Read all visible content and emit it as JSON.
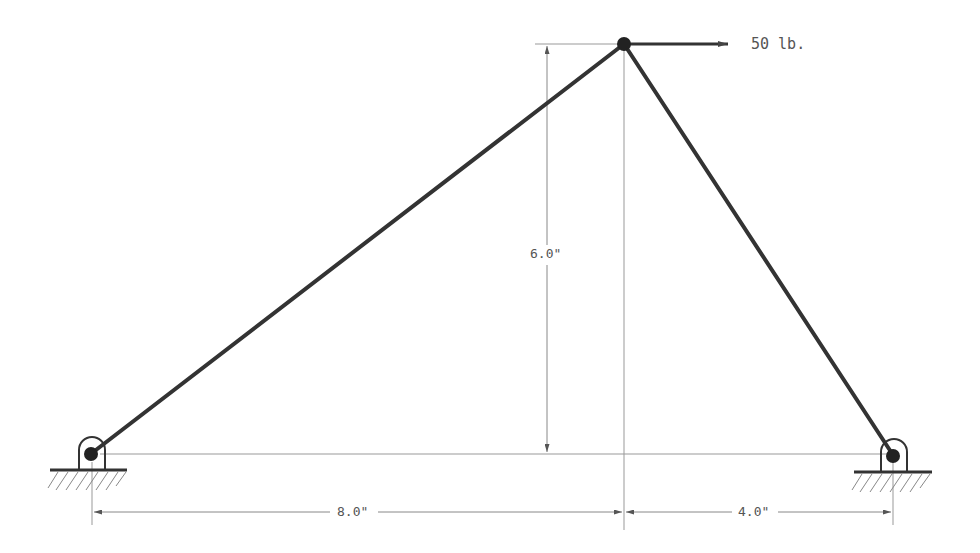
{
  "diagram": {
    "type": "truss",
    "members": [
      {
        "name": "left-member",
        "from": "left-support",
        "to": "apex"
      },
      {
        "name": "right-member",
        "from": "apex",
        "to": "right-support"
      }
    ],
    "nodes": [
      {
        "name": "left-support",
        "kind": "pin"
      },
      {
        "name": "right-support",
        "kind": "pin"
      },
      {
        "name": "apex",
        "kind": "joint"
      }
    ],
    "load": {
      "label": "50 lb.",
      "direction": "right",
      "at": "apex"
    },
    "dimensions": {
      "height": "6.0\"",
      "left_span": "8.0\"",
      "right_span": "4.0\""
    },
    "colors": {
      "member": "#333333",
      "dimension": "#888888",
      "text": "#555555"
    }
  }
}
